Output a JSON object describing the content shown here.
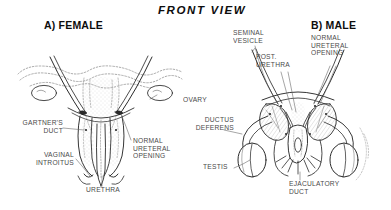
{
  "figure": {
    "title": "FRONT VIEW",
    "panels": [
      {
        "id": "female",
        "heading": "A) FEMALE"
      },
      {
        "id": "male",
        "heading": "B) MALE"
      }
    ],
    "labels": {
      "ovary": "OVARY",
      "gartners_duct": "GARTNER'S\nDUCT",
      "vaginal_introitus": "VAGINAL\nINTROITUS",
      "normal_ureteral_opening_female": "NORMAL\nURETERAL\nOPENING",
      "urethra": "URETHRA",
      "seminal_vesicle": "SEMINAL\nVESICLE",
      "post_urethra": "POST.\nURETHRA",
      "normal_ureteral_opening_male": "NORMAL\nURETERAL\nOPENING",
      "ductus_deferens": "DUCTUS\nDEFERENS",
      "testis": "TESTIS",
      "ejaculatory_duct": "EJACULATORY\nDUCT"
    },
    "colors": {
      "ink": "#1a1a1a",
      "label_text": "#4a4a4a",
      "heading_text": "#0d0d0d",
      "dotted_outline": "#8a8a8a",
      "stipple": "#b5b5b5",
      "background": "#ffffff"
    }
  }
}
